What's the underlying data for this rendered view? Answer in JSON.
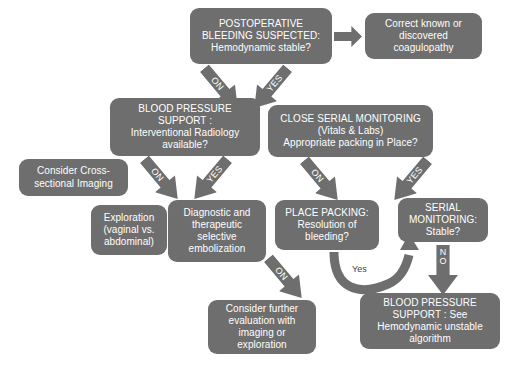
{
  "diagram": {
    "colors": {
      "node_fill": "#6e6e6e",
      "node_text": "#ffffff",
      "arrow_fill": "#6e6e6e",
      "background": "#ffffff",
      "plain_label_text": "#3f3f3f"
    },
    "nodes": [
      {
        "id": "n1",
        "text": "POSTOPERATIVE\nBLEEDING SUSPECTED:\nHemodynamic stable?"
      },
      {
        "id": "n2",
        "text": "Correct known or\ndiscovered\ncoagulopathy"
      },
      {
        "id": "n3",
        "text": "BLOOD PRESSURE\nSUPPORT :\nInterventional Radiology\navailable?"
      },
      {
        "id": "n4",
        "text": "CLOSE SERIAL MONITORING\n(Vitals & Labs)\nAppropriate packing in Place?"
      },
      {
        "id": "n5",
        "text": "Consider Cross-\nsectional Imaging"
      },
      {
        "id": "n6",
        "text": "Exploration\n(vaginal vs.\nabdominal)"
      },
      {
        "id": "n7",
        "text": "Diagnostic and\ntherapeutic\nselective\nembolization"
      },
      {
        "id": "n8",
        "text": "PLACE PACKING:\nResolution of\nbleeding?"
      },
      {
        "id": "n9",
        "text": "SERIAL\nMONITORING:\nStable?"
      },
      {
        "id": "n10",
        "text": "Consider further\nevaluation with\nimaging or\nexploration"
      },
      {
        "id": "n11",
        "text": "BLOOD PRESSURE\nSUPPORT : See\nHemodynamic unstable\nalgorithm"
      }
    ],
    "edge_labels": {
      "n1_no": "NO",
      "n1_yes": "YES",
      "n3_no": "NO",
      "n3_yes": "YES",
      "n4_no": "NO",
      "n4_yes": "YES",
      "n8_no": "NO",
      "n8_yes": "Yes",
      "n9_no_line1": "N",
      "n9_no_line2": "O"
    }
  }
}
